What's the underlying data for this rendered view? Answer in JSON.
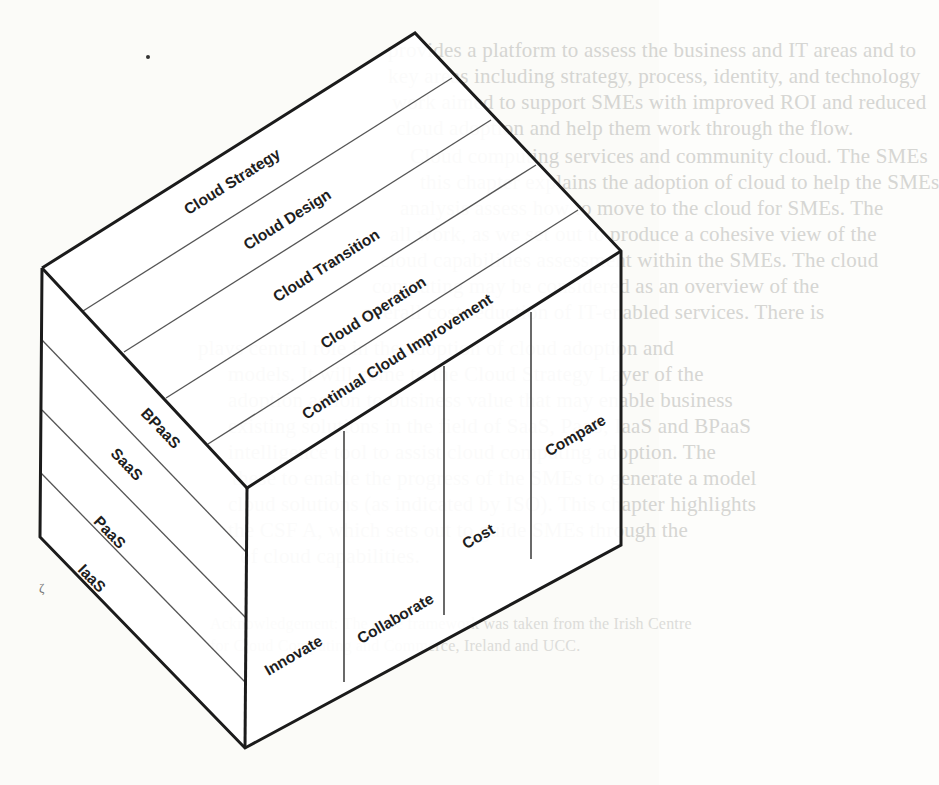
{
  "diagram": {
    "type": "isometric-cube",
    "top_face": {
      "title": "Cloud lifecycle stages",
      "bands": [
        "Cloud Strategy",
        "Cloud Design",
        "Cloud Transition",
        "Cloud Operation",
        "Continual Cloud Improvement"
      ]
    },
    "left_face": {
      "title": "Cloud service models",
      "bands": [
        "BPaaS",
        "SaaS",
        "PaaS",
        "IaaS"
      ]
    },
    "front_face": {
      "title": "Cloud capabilities",
      "columns": [
        "Innovate",
        "Collaborate",
        "Cost",
        "Compare"
      ]
    },
    "colors": {
      "edge": "#1b1b1b",
      "divider": "#555555",
      "label": "#1e1e1e",
      "background": "#fbfbf8",
      "bleed_text": "#c9c9c6"
    }
  },
  "background_page": {
    "lines": [
      "provides a platform to assess the business and IT areas and to",
      "key areas including strategy, process, identity, and technology",
      "work aimed to support SMEs with improved ROI and reduced",
      "cloud adoption and help them work through the flow.",
      "Cloud computing services and community cloud. The SMEs",
      "this chapter explains the adoption of cloud to help the SMEs",
      "analysis assess how to move to the cloud for SMEs. The",
      "all work, as we set out to produce a cohesive view of the",
      "cloud capabilities assessment within the SMEs. The cloud",
      "computing may be considered as an overview of the",
      "overall cost reduction of IT-enabled services. There is",
      "plays central role in the adoption of cloud adoption and",
      "models. It will come to the Cloud Strategy Layer of the",
      "adoption action to business value that may enable business",
      "existing solutions in the field of SaaS, PaaS, IaaS and BPaaS",
      "intelligence tool to assist cloud computing adoption. The",
      "these to enable the progress of the SMEs to generate a model",
      "cloud solutions (as indicated by ISO). This chapter highlights",
      "the CSF A, which sets out to guide SMEs through the",
      "of cloud capabilities."
    ],
    "caption": [
      "Acknowledgement: The cube framework was taken from the Irish Centre",
      "for Cloud Computing and Commerce, Ireland and UCC."
    ]
  }
}
